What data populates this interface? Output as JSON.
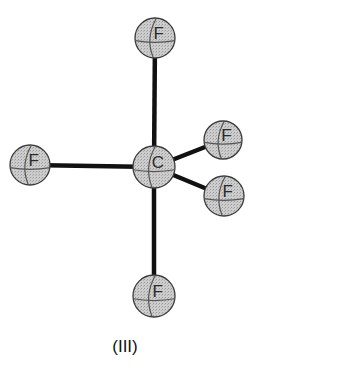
{
  "diagram": {
    "caption": "(III)",
    "colors": {
      "bond": "#111111",
      "atom_fill": "#c9c9c9",
      "atom_stroke": "#3a3a3a",
      "grid_line": "#555555"
    },
    "atoms": [
      {
        "id": "F-top",
        "symbol": "F",
        "x": 155,
        "y": 38,
        "r": 20
      },
      {
        "id": "F-left",
        "symbol": "F",
        "x": 30,
        "y": 165,
        "r": 20
      },
      {
        "id": "C-center",
        "symbol": "C",
        "x": 154,
        "y": 167,
        "r": 21
      },
      {
        "id": "F-upper-right",
        "symbol": "F",
        "x": 223,
        "y": 140,
        "r": 19
      },
      {
        "id": "F-lower-right",
        "symbol": "F",
        "x": 224,
        "y": 196,
        "r": 20
      },
      {
        "id": "F-bottom",
        "symbol": "F",
        "x": 154,
        "y": 296,
        "r": 21
      }
    ],
    "bonds": [
      {
        "from": "C-center",
        "to": "F-top"
      },
      {
        "from": "C-center",
        "to": "F-left"
      },
      {
        "from": "C-center",
        "to": "F-upper-right"
      },
      {
        "from": "C-center",
        "to": "F-lower-right"
      },
      {
        "from": "C-center",
        "to": "F-bottom"
      }
    ]
  }
}
